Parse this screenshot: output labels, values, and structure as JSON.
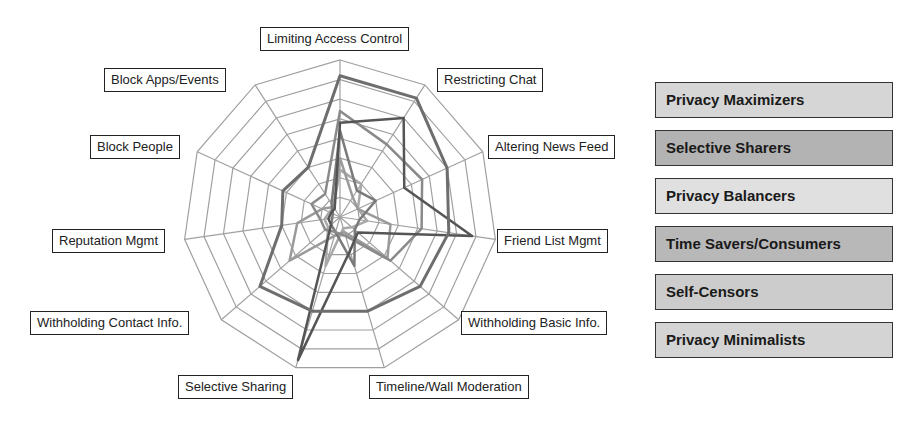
{
  "chart_data": {
    "type": "radar",
    "title": "",
    "axes": [
      "Limiting Access Control",
      "Restricting Chat",
      "Altering News Feed",
      "Friend List Mgmt",
      "Withholding Basic Info.",
      "Timeline/Wall Moderation",
      "Selective Sharing",
      "Withholding Contact Info.",
      "Reputation Mgmt",
      "Block People",
      "Block Apps/Events"
    ],
    "rings": 8,
    "max": 8,
    "grid": true,
    "legend_position": "right",
    "series": [
      {
        "name": "Privacy Maximizers",
        "color": "#6e6e6e",
        "width": 3,
        "values": [
          7.2,
          7.2,
          6.0,
          5.6,
          5.4,
          5.0,
          5.0,
          5.4,
          3.0,
          3.2,
          3.0
        ]
      },
      {
        "name": "Selective Sharers",
        "color": "#555555",
        "width": 2.5,
        "values": [
          4.8,
          6.0,
          3.6,
          6.8,
          1.2,
          1.8,
          7.6,
          0.6,
          0.6,
          0.5,
          0.5
        ]
      },
      {
        "name": "Privacy Balancers",
        "color": "#8a8a8a",
        "width": 2.5,
        "values": [
          5.4,
          4.4,
          4.6,
          4.2,
          3.4,
          1.0,
          0.8,
          1.0,
          1.0,
          1.6,
          1.4
        ]
      },
      {
        "name": "Time Savers/Consumers",
        "color": "#7a7a7a",
        "width": 2.5,
        "values": [
          4.4,
          1.6,
          2.0,
          1.0,
          1.0,
          2.6,
          0.8,
          0.6,
          0.4,
          0.4,
          0.8
        ]
      },
      {
        "name": "Self-Censors",
        "color": "#9a9a9a",
        "width": 2.5,
        "values": [
          3.0,
          1.2,
          1.0,
          2.6,
          3.2,
          0.8,
          1.0,
          3.4,
          2.2,
          1.0,
          0.6
        ]
      },
      {
        "name": "Privacy Minimalists",
        "color": "#a8a8a8",
        "width": 2.5,
        "values": [
          2.4,
          2.0,
          1.0,
          1.4,
          0.8,
          0.6,
          2.6,
          0.8,
          0.8,
          0.6,
          0.6
        ]
      }
    ]
  },
  "axis_labels": {
    "a0": "Limiting Access Control",
    "a1": "Restricting Chat",
    "a2": "Altering News Feed",
    "a3": "Friend List Mgmt",
    "a4": "Withholding Basic Info.",
    "a5": "Timeline/Wall Moderation",
    "a6": "Selective Sharing",
    "a7": "Withholding Contact Info.",
    "a8": "Reputation Mgmt",
    "a9": "Block People",
    "a10": "Block Apps/Events"
  },
  "legend": {
    "items": [
      {
        "label": "Privacy Maximizers",
        "bg": "#d6d6d6"
      },
      {
        "label": "Selective Sharers",
        "bg": "#b3b3b3"
      },
      {
        "label": "Privacy Balancers",
        "bg": "#e0e0e0"
      },
      {
        "label": "Time Savers/Consumers",
        "bg": "#b8b8b8"
      },
      {
        "label": "Self-Censors",
        "bg": "#cccccc"
      },
      {
        "label": "Privacy Minimalists",
        "bg": "#d4d4d4"
      }
    ]
  }
}
